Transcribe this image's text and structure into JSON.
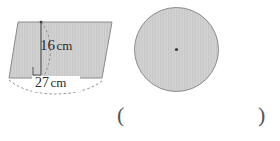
{
  "page": {
    "width": 280,
    "height": 141,
    "background": "#ffffff"
  },
  "style": {
    "fill_color": "#d2d2d2",
    "hatch_color": "#c2c2c2",
    "stroke_color": "#8a8a8a",
    "dash_color": "#8a8a8a",
    "text_color": "#2b2b2b",
    "paren_color": "#555555",
    "center_dot_color": "#3a3a3a"
  },
  "figures": {
    "parallelogram": {
      "name": "parallelogram",
      "points": "18,22 112,22 102,78 9,78",
      "height_line": {
        "x": 41,
        "y_top": 22,
        "y_bottom": 74
      },
      "right_angle_marker": {
        "x": 33,
        "y": 66,
        "size": 8
      },
      "slant_arc": "M 41,22 C 52,36 52,58 44,76",
      "base_arc": "M 9,80 C 40,93 72,93 103,80",
      "height_label": "16",
      "height_unit": "cm",
      "base_label": "27",
      "base_unit": "cm"
    },
    "circle": {
      "name": "circle",
      "cx": 176.5,
      "cy": 49.5,
      "r": 42,
      "center_dot_r": 1.6
    }
  },
  "answer_field": {
    "open_paren": "(",
    "close_paren": ")"
  }
}
